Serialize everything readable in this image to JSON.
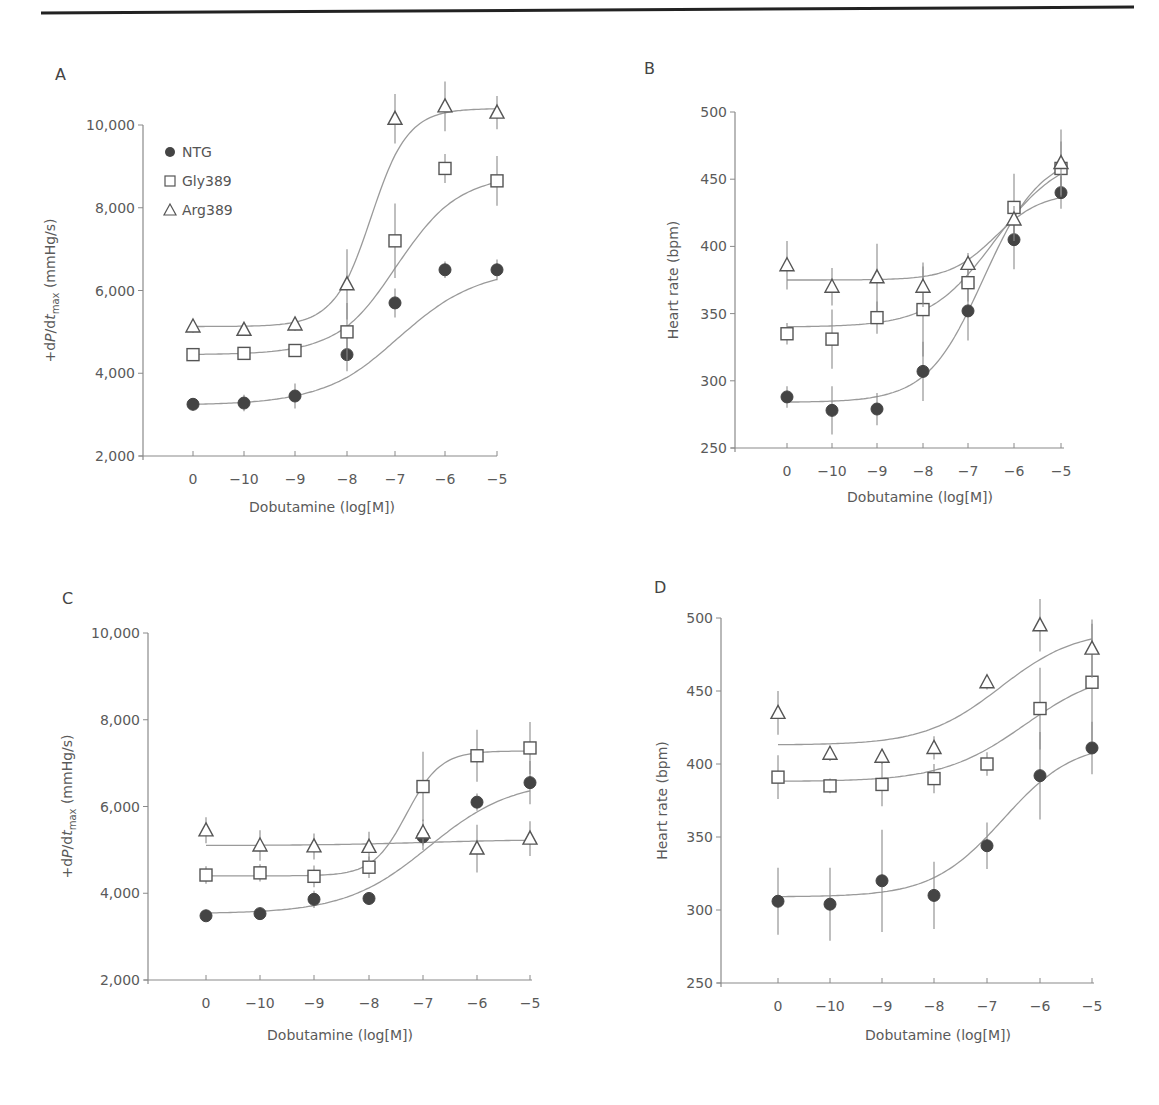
{
  "header_rule": {
    "x1": 41,
    "y1": 13,
    "x2": 1134,
    "y2": 7,
    "color": "#222222"
  },
  "legend": {
    "items": [
      {
        "series": "NTG",
        "label": "NTG",
        "marker": "filled-circle"
      },
      {
        "series": "Gly389",
        "label": "Gly389",
        "marker": "open-square"
      },
      {
        "series": "Arg389",
        "label": "Arg389",
        "marker": "open-triangle"
      }
    ]
  },
  "colors": {
    "ink": "#444444",
    "axis": "#8a8a8a",
    "curve": "#9a9a9a",
    "text": "#5a5a5a"
  },
  "chart_data": [
    {
      "panel": "A",
      "type": "line",
      "title": "",
      "xlabel": "Dobutamine (log[M])",
      "ylabel": "+dP/dt_max (mmHg/s)",
      "categories": [
        "0",
        "−10",
        "−9",
        "−8",
        "−7",
        "−6",
        "−5"
      ],
      "yticks": [
        "2,000",
        "4,000",
        "6,000",
        "8,000",
        "10,000"
      ],
      "ylim": [
        2000,
        10000
      ],
      "grid": false,
      "legend_position": "upper-left",
      "series": [
        {
          "name": "NTG",
          "marker": "filled-circle",
          "values": [
            3250,
            3280,
            3450,
            4450,
            5700,
            6500,
            6500
          ],
          "errors": [
            150,
            200,
            300,
            400,
            350,
            200,
            250
          ]
        },
        {
          "name": "Gly389",
          "marker": "open-square",
          "values": [
            4450,
            4480,
            4550,
            5000,
            7200,
            8950,
            8650
          ],
          "errors": [
            100,
            100,
            150,
            700,
            900,
            350,
            600
          ]
        },
        {
          "name": "Arg389",
          "marker": "open-triangle",
          "values": [
            5130,
            5050,
            5180,
            6150,
            10150,
            10450,
            10300
          ],
          "errors": [
            150,
            100,
            150,
            850,
            600,
            600,
            400
          ]
        }
      ],
      "fit_curves": {
        "NTG": {
          "bottom": 3230,
          "top": 6550,
          "center": 4.1,
          "slope": 1.25
        },
        "Gly389": {
          "bottom": 4450,
          "top": 8800,
          "center": 4.05,
          "slope": 1.6
        },
        "Arg389": {
          "bottom": 5130,
          "top": 10400,
          "center": 3.5,
          "slope": 2.6
        }
      }
    },
    {
      "panel": "B",
      "type": "line",
      "title": "",
      "xlabel": "Dobutamine (log[M])",
      "ylabel": "Heart rate (bpm)",
      "categories": [
        "0",
        "−10",
        "−9",
        "−8",
        "−7",
        "−6",
        "−5"
      ],
      "yticks": [
        "250",
        "300",
        "350",
        "400",
        "450",
        "500"
      ],
      "ylim": [
        250,
        500
      ],
      "grid": false,
      "series": [
        {
          "name": "NTG",
          "marker": "filled-circle",
          "values": [
            288,
            278,
            279,
            307,
            352,
            405,
            440
          ],
          "errors": [
            8,
            18,
            12,
            22,
            22,
            22,
            12
          ]
        },
        {
          "name": "Gly389",
          "marker": "open-square",
          "values": [
            335,
            331,
            347,
            353,
            373,
            429,
            458
          ],
          "errors": [
            8,
            22,
            12,
            35,
            14,
            25,
            20
          ]
        },
        {
          "name": "Arg389",
          "marker": "open-triangle",
          "values": [
            386,
            370,
            377,
            370,
            387,
            420,
            462
          ],
          "errors": [
            18,
            14,
            25,
            15,
            8,
            10,
            25
          ]
        }
      ],
      "fit_curves": {
        "NTG": {
          "bottom": 284,
          "top": 470,
          "center": 4.35,
          "slope": 1.6
        },
        "Gly389": {
          "bottom": 340,
          "top": 470,
          "center": 4.6,
          "slope": 1.4
        },
        "Arg389": {
          "bottom": 375,
          "top": 440,
          "center": 4.6,
          "slope": 2.0
        }
      }
    },
    {
      "panel": "C",
      "type": "line",
      "title": "",
      "xlabel": "Dobutamine (log[M])",
      "ylabel": "+dP/dt_max (mmHg/s)",
      "categories": [
        "0",
        "−10",
        "−9",
        "−8",
        "−7",
        "−6",
        "−5"
      ],
      "yticks": [
        "2,000",
        "4,000",
        "6,000",
        "8,000",
        "10,000"
      ],
      "ylim": [
        2000,
        10000
      ],
      "grid": false,
      "series": [
        {
          "name": "NTG",
          "marker": "filled-circle",
          "values": [
            3480,
            3530,
            3860,
            3880,
            5300,
            6100,
            6550
          ],
          "errors": [
            100,
            100,
            200,
            150,
            300,
            200,
            500
          ]
        },
        {
          "name": "Gly389",
          "marker": "open-square",
          "values": [
            4420,
            4470,
            4390,
            4600,
            6460,
            7170,
            7350
          ],
          "errors": [
            200,
            200,
            250,
            250,
            800,
            600,
            600
          ]
        },
        {
          "name": "Arg389",
          "marker": "open-triangle",
          "values": [
            5450,
            5100,
            5080,
            5070,
            5400,
            5030,
            5260
          ],
          "errors": [
            300,
            350,
            300,
            350,
            300,
            550,
            400
          ]
        }
      ],
      "fit_curves": {
        "NTG": {
          "bottom": 3530,
          "top": 6600,
          "center": 4.1,
          "slope": 1.3
        },
        "Gly389": {
          "bottom": 4400,
          "top": 7280,
          "center": 3.7,
          "slope": 3.2
        },
        "Arg389": {
          "bottom": 5100,
          "top": 5240,
          "center": 4.0,
          "slope": 1.0
        }
      }
    },
    {
      "panel": "D",
      "type": "line",
      "title": "",
      "xlabel": "Dobutamine (log[M])",
      "ylabel": "Heart rate (bpm)",
      "categories": [
        "0",
        "−10",
        "−9",
        "−8",
        "−7",
        "−6",
        "−5"
      ],
      "yticks": [
        "250",
        "300",
        "350",
        "400",
        "450",
        "500"
      ],
      "ylim": [
        250,
        500
      ],
      "grid": false,
      "series": [
        {
          "name": "NTG",
          "marker": "filled-circle",
          "values": [
            306,
            304,
            320,
            310,
            344,
            392,
            411
          ],
          "errors": [
            23,
            25,
            35,
            23,
            16,
            30,
            18
          ]
        },
        {
          "name": "Gly389",
          "marker": "open-square",
          "values": [
            391,
            385,
            386,
            390,
            400,
            438,
            456
          ],
          "errors": [
            15,
            5,
            15,
            10,
            8,
            28,
            40
          ]
        },
        {
          "name": "Arg389",
          "marker": "open-triangle",
          "values": [
            435,
            407,
            405,
            411,
            456,
            495,
            479
          ],
          "errors": [
            15,
            5,
            5,
            8,
            5,
            18,
            20
          ]
        }
      ],
      "fit_curves": {
        "NTG": {
          "bottom": 309,
          "top": 415,
          "center": 4.3,
          "slope": 1.5
        },
        "Gly389": {
          "bottom": 388,
          "top": 465,
          "center": 4.7,
          "slope": 1.3
        },
        "Arg389": {
          "bottom": 413,
          "top": 492,
          "center": 4.25,
          "slope": 1.4
        }
      }
    }
  ],
  "panels_layout": [
    {
      "letter": "A",
      "letter_x": 55,
      "letter_y": 80,
      "axis_x": 143,
      "axis_y_top": 125,
      "axis_y_bottom": 456,
      "x_ticks": [
        193,
        244,
        295,
        347,
        395,
        445,
        497
      ],
      "x_end": 497,
      "ylabel_x": 55,
      "xlabel_x": 322,
      "xlabel_y": 512,
      "legend": true,
      "legend_x": 165,
      "legend_y": 152
    },
    {
      "letter": "B",
      "letter_x": 644,
      "letter_y": 74,
      "axis_x": 735,
      "axis_y_top": 112,
      "axis_y_bottom": 448,
      "x_ticks": [
        787,
        832,
        877,
        923,
        968,
        1014,
        1061
      ],
      "x_end": 1064,
      "ylabel_x": 678,
      "xlabel_x": 920,
      "xlabel_y": 502,
      "legend": false
    },
    {
      "letter": "C",
      "letter_x": 62,
      "letter_y": 604,
      "axis_x": 148,
      "axis_y_top": 633,
      "axis_y_bottom": 980,
      "x_ticks": [
        206,
        260,
        314,
        369,
        423,
        477,
        530
      ],
      "x_end": 532,
      "ylabel_x": 72,
      "xlabel_x": 340,
      "xlabel_y": 1040,
      "legend": false
    },
    {
      "letter": "D",
      "letter_x": 654,
      "letter_y": 593,
      "axis_x": 721,
      "axis_y_top": 618,
      "axis_y_bottom": 983,
      "x_ticks": [
        778,
        830,
        882,
        934,
        987,
        1040,
        1092
      ],
      "x_end": 1094,
      "ylabel_x": 667,
      "xlabel_x": 938,
      "xlabel_y": 1040,
      "legend": false
    }
  ]
}
